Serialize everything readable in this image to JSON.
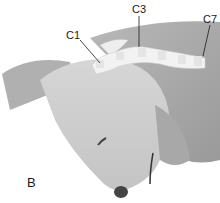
{
  "figure": {
    "panel_label": "B",
    "labels": [
      {
        "text": "C1",
        "x": 66,
        "y": 30
      },
      {
        "text": "C3",
        "x": 132,
        "y": 4
      },
      {
        "text": "C7",
        "x": 204,
        "y": 14
      }
    ]
  }
}
